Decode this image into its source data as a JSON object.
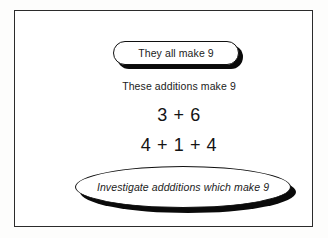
{
  "diagram": {
    "type": "worksheet-concept-diagram",
    "frame": {
      "border_color": "#2b2b2b",
      "background_color": "#ffffff"
    },
    "callout_pill": {
      "text": "They all make 9",
      "shape": "rounded-pill",
      "shadow_color": "#0a0a0a",
      "outline_color": "#101010"
    },
    "heading": {
      "text": "These additions make 9"
    },
    "sums": [
      {
        "text": "3 + 6"
      },
      {
        "text": "4 + 1 + 4"
      }
    ],
    "task_ellipse": {
      "text": "Investigate addditions which make 9",
      "shape": "ellipse",
      "style": "italic",
      "shadow_color": "#0a0a0a",
      "outline_color": "#101010"
    }
  }
}
